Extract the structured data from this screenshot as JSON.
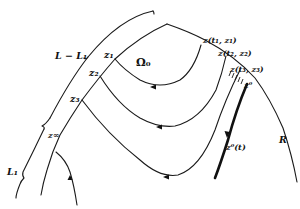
{
  "labels": {
    "brace_upper": "L − L₁",
    "brace_lower": "L₁",
    "region": "Ω₀",
    "z1": "z₁",
    "z2": "z₂",
    "z3": "z₃",
    "z_inf": "z∞",
    "zt1": "z(t₁, z₁)",
    "zt2": "z(t₂, z₂)",
    "zt3": "z(t₃, z₃)",
    "z0": "z⁰",
    "z0t": "z⁰(t)",
    "R": "R"
  },
  "colors": {
    "ink": "#111111",
    "background": "#ffffff"
  }
}
